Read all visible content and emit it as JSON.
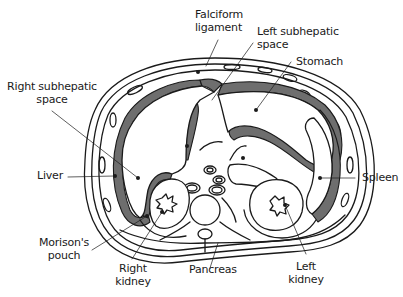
{
  "diagram": {
    "title": "",
    "type": "anatomical cross-section (transverse abdomen)",
    "colors": {
      "outline": "#1a1a1a",
      "fluid_space": "#6e6e6e",
      "background": "#ffffff"
    },
    "labels": {
      "falciform_ligament": "Falciform\nligament",
      "left_subhepatic_space": "Left subhepatic\nspace",
      "stomach": "Stomach",
      "right_subhepatic_space": "Right subhepatic\nspace",
      "liver": "Liver",
      "spleen": "Spleen",
      "morisons_pouch": "Morison's\npouch",
      "right_kidney": "Right\nkidney",
      "pancreas": "Pancreas",
      "left_kidney": "Left\nkidney"
    }
  }
}
